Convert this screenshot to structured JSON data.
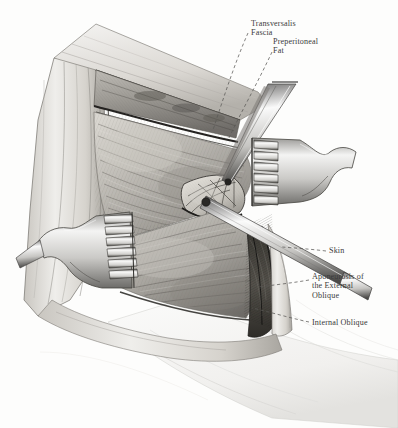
{
  "figure": {
    "medium": "engraving",
    "palette": {
      "paper": "#fdfdfc",
      "ink": "#2b2b2b",
      "label_ink": "#3a3a3a",
      "tissue_light": "#e8e6e2",
      "tissue_mid": "#bdbab4",
      "tissue_dark": "#6f6c68",
      "shadow": "#3c3a37",
      "steel_light": "#f2f2f1",
      "steel_mid": "#b8b8b6",
      "steel_dark": "#565553"
    }
  },
  "labels": [
    {
      "id": "transversalis-fascia",
      "text": "Transversalis\nFascia",
      "x": 251,
      "y": 19
    },
    {
      "id": "preperitoneal-fat",
      "text": "Preperitoneal\nFat",
      "x": 273,
      "y": 37
    },
    {
      "id": "skin",
      "text": "Skin",
      "x": 329,
      "y": 246
    },
    {
      "id": "aponeurosis",
      "text": "Aponeurosis of\nthe External\nOblique",
      "x": 312,
      "y": 272
    },
    {
      "id": "internal-oblique",
      "text": "Internal Oblique",
      "x": 312,
      "y": 318
    }
  ],
  "leaders": [
    {
      "id": "leader-transversalis",
      "from": [
        248,
        33
      ],
      "to": [
        213,
        130
      ]
    },
    {
      "id": "leader-preperitoneal",
      "from": [
        272,
        52
      ],
      "to": [
        228,
        140
      ]
    },
    {
      "id": "leader-skin",
      "from": [
        326,
        251
      ],
      "to": [
        282,
        247
      ]
    },
    {
      "id": "leader-aponeurosis",
      "from": [
        309,
        280
      ],
      "to": [
        258,
        287
      ]
    },
    {
      "id": "leader-internal",
      "from": [
        309,
        322
      ],
      "to": [
        252,
        308
      ]
    }
  ],
  "instruments": [
    {
      "id": "retractor-right",
      "kind": "toothed-retractor",
      "teeth": 6,
      "x": 250,
      "y": 140
    },
    {
      "id": "retractor-left",
      "kind": "toothed-retractor",
      "teeth": 6,
      "x": 78,
      "y": 230
    },
    {
      "id": "forceps",
      "kind": "forceps",
      "x": 252,
      "y": 88
    },
    {
      "id": "probe",
      "kind": "blunt-probe",
      "x": 215,
      "y": 205
    }
  ],
  "structures": [
    {
      "id": "skin-flap-left",
      "name": "retracted skin flap, left"
    },
    {
      "id": "skin-flap-upper",
      "name": "retracted skin flap, upper"
    },
    {
      "id": "external-oblique",
      "name": "aponeurosis of external oblique"
    },
    {
      "id": "internal-oblique",
      "name": "internal oblique muscle belly"
    },
    {
      "id": "transversalis-fascia",
      "name": "transversalis fascia"
    },
    {
      "id": "preperitoneal-fat",
      "name": "preperitoneal fat with vessels"
    },
    {
      "id": "wound-depth",
      "name": "depth of wound"
    },
    {
      "id": "drape",
      "name": "surgical drape / body contour"
    }
  ]
}
